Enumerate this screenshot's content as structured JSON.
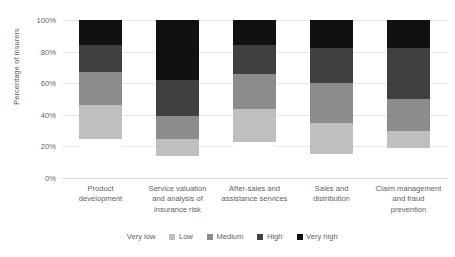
{
  "chart_data": {
    "type": "bar",
    "subtype": "stacked-bar-100",
    "title": "",
    "xlabel": "",
    "ylabel": "Percentage of insurers",
    "ylim": [
      0,
      100
    ],
    "ytick_labels": [
      "100%",
      "80%",
      "60%",
      "40%",
      "20%",
      "0%"
    ],
    "ytick_values": [
      100,
      80,
      60,
      40,
      20,
      0
    ],
    "grid": true,
    "legend_position": "bottom",
    "categories": [
      "Product development",
      "Service valuation and analysis of insurance risk",
      "After-sales and assistance services",
      "Sales and distribution",
      "Claim management and fraud prevention"
    ],
    "category_lines": [
      [
        "Product",
        "development"
      ],
      [
        "Service valuation",
        "and analysis of",
        "insurance risk"
      ],
      [
        "After-sales and",
        "assistance services"
      ],
      [
        "Sales and",
        "distribution"
      ],
      [
        "Claim management",
        "and fraud",
        "prevention"
      ]
    ],
    "series": [
      {
        "name": "Very low",
        "color": "#ffffff",
        "values": [
          25,
          15,
          23,
          15,
          19
        ]
      },
      {
        "name": "Low",
        "color": "#bfbfbf",
        "values": [
          21,
          12,
          21,
          20,
          11
        ]
      },
      {
        "name": "Medium",
        "color": "#8c8c8c",
        "values": [
          21,
          16,
          22,
          25,
          20
        ]
      },
      {
        "name": "High",
        "color": "#404040",
        "values": [
          17,
          25,
          18,
          22,
          32
        ]
      },
      {
        "name": "Very high",
        "color": "#111111",
        "values": [
          16,
          42,
          16,
          18,
          18
        ]
      }
    ]
  },
  "axis": {
    "y_title": "Percentage of insurers"
  },
  "colors": {
    "gridline": "#e8e8e8",
    "axis": "#d9d9d9",
    "text": "#5f5f5f"
  }
}
